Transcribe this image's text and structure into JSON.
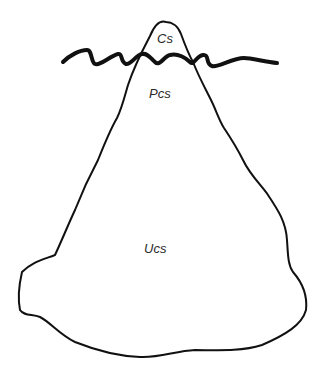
{
  "diagram": {
    "type": "iceberg",
    "labels": {
      "tip": "Cs",
      "middle": "Pcs",
      "base": "Ucs"
    },
    "colors": {
      "stroke": "#111111",
      "background": "#ffffff",
      "text": "#2a2a2a"
    }
  }
}
